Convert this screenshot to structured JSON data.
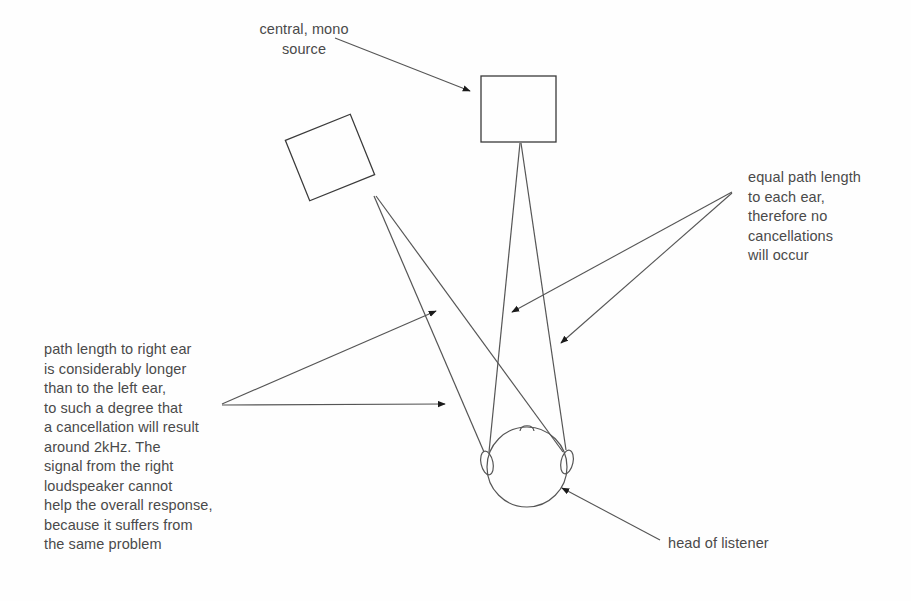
{
  "figure": {
    "background_color": "#ffffff",
    "line_color": "#555555",
    "text_color": "#4a4a4a"
  },
  "labels": {
    "central_source": "central, mono\nsource",
    "equal_path": "equal path length\nto each ear,\ntherefore no\ncancellations\nwill occur",
    "path_length": "path length to right ear\nis considerably longer\nthan to the left ear,\nto such a degree that\na cancellation will result\naround 2kHz. The\nsignal from the right\nloudspeaker cannot\nhelp the overall response,\nbecause it suffers from\nthe same problem",
    "head_of_listener": "head of listener"
  },
  "objects": {
    "center_speaker": {
      "name": "central mono loudspeaker",
      "shape": "rectangle",
      "x": 481,
      "y": 76,
      "width": 75,
      "height": 66,
      "rotation_deg": 0
    },
    "left_speaker": {
      "name": "left loudspeaker",
      "shape": "rectangle",
      "x": 295,
      "y": 125,
      "width": 70,
      "height": 65,
      "rotation_deg": -22
    },
    "listener_head": {
      "name": "head of listener",
      "shape": "circle",
      "cx": 527,
      "cy": 467,
      "r": 40
    },
    "left_ear": {
      "cx": 487,
      "cy": 463,
      "rx": 6,
      "ry": 12,
      "rotation_deg": -12
    },
    "right_ear": {
      "cx": 567,
      "cy": 462,
      "rx": 6,
      "ry": 12,
      "rotation_deg": 12
    },
    "nose": {
      "cx": 527,
      "cy": 428
    }
  },
  "signal_paths": [
    {
      "from": "center_speaker",
      "to": "left_ear",
      "x1": 520,
      "y1": 143,
      "x2": 489,
      "y2": 452
    },
    {
      "from": "center_speaker",
      "to": "right_ear",
      "x1": 521,
      "y1": 143,
      "x2": 566,
      "y2": 450
    },
    {
      "from": "left_speaker",
      "to": "left_ear",
      "x1": 374,
      "y1": 196,
      "x2": 484,
      "y2": 452
    },
    {
      "from": "left_speaker",
      "to": "right_ear",
      "x1": 376,
      "y1": 196,
      "x2": 563,
      "y2": 452
    }
  ],
  "leaders": [
    {
      "name": "central-source-leader",
      "x1": 335,
      "y1": 38,
      "x2": 470,
      "y2": 91
    },
    {
      "name": "equal-path-leader-1",
      "x1": 732,
      "y1": 192,
      "x2": 510,
      "y2": 312
    },
    {
      "name": "equal-path-leader-2",
      "x1": 732,
      "y1": 193,
      "x2": 559,
      "y2": 343
    },
    {
      "name": "path-length-leader-1",
      "x1": 222,
      "y1": 404,
      "x2": 438,
      "y2": 310
    },
    {
      "name": "path-length-leader-2",
      "x1": 222,
      "y1": 405,
      "x2": 447,
      "y2": 404
    },
    {
      "name": "head-listener-leader",
      "x1": 660,
      "y1": 540,
      "x2": 560,
      "y2": 487
    }
  ]
}
